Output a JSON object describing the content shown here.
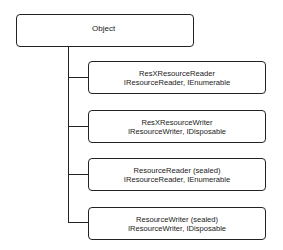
{
  "diagram": {
    "type": "class-hierarchy",
    "root": {
      "label": "Object"
    },
    "children": [
      {
        "name": "ResXResourceReader",
        "interfaces": "IResourceReader, IEnumerable"
      },
      {
        "name": "ResXResourceWriter",
        "interfaces": "IResourceWriter, IDisposable"
      },
      {
        "name": "ResourceReader (sealed)",
        "interfaces": "IResourceReader, IEnumerable"
      },
      {
        "name": "ResourceWriter (sealed)",
        "interfaces": "IResourceWriter, IDisposable"
      }
    ],
    "colors": {
      "line": "#222222",
      "background": "#ffffff",
      "text": "#1a1a1a"
    }
  }
}
